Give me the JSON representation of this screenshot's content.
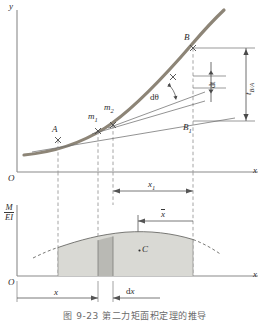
{
  "figure": {
    "caption": "图 9-23  第二力矩面积定理的推导",
    "title_id": "9-23"
  },
  "colors": {
    "curve": "#8d8577",
    "axis": "#8a8a8a",
    "dashed": "#9a9a9a",
    "dim": "#555555",
    "shade_light": "#d9d9d4",
    "shade_dark": "#b9b9b4",
    "text": "#2b2b2b"
  },
  "upper_plot": {
    "y_axis_label": "y",
    "x_axis_label": "x",
    "origin_label": "O",
    "points": [
      {
        "name": "A",
        "label": "A"
      },
      {
        "name": "m1",
        "label": "m",
        "sub": "1"
      },
      {
        "name": "m2",
        "label": "m",
        "sub": "2"
      },
      {
        "name": "B",
        "label": "B"
      },
      {
        "name": "B1",
        "label": "B",
        "sub": "1"
      }
    ],
    "dimensions": [
      {
        "name": "dtheta",
        "label": "dθ"
      },
      {
        "name": "dt",
        "label": "dt"
      },
      {
        "name": "t-BA",
        "label": "t",
        "sub": "B/A"
      }
    ]
  },
  "mid_dimension": {
    "x1_label": "x",
    "x1_sub": "1"
  },
  "lower_plot": {
    "y_axis_num": "M",
    "y_axis_den": "EI",
    "x_axis_label": "x",
    "origin_label": "O",
    "centroid_label": "C",
    "xbar_label": "x"
  },
  "bottom_dimension": {
    "x_label": "x",
    "dx_label": "dx"
  }
}
